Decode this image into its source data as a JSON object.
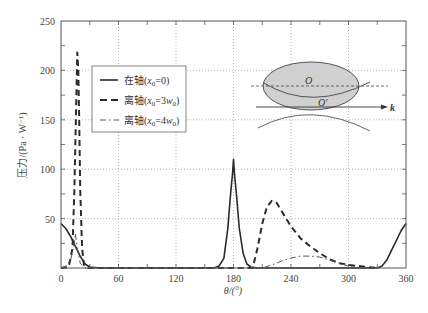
{
  "chart_data": {
    "type": "line",
    "title": "",
    "xlabel": "θ/(°)",
    "ylabel": "压力/(Pa · W⁻¹)",
    "xlim": [
      0,
      360
    ],
    "ylim": [
      0,
      250
    ],
    "xticks": [
      0,
      60,
      120,
      180,
      240,
      300,
      360
    ],
    "yticks": [
      50,
      100,
      150,
      200,
      250
    ],
    "grid": true,
    "legend_position": "upper-left-inside",
    "series": [
      {
        "name": "在轴(x0=0)",
        "style": "solid",
        "x": [
          0,
          5,
          10,
          15,
          20,
          25,
          30,
          40,
          160,
          165,
          170,
          174,
          177,
          179,
          180,
          181,
          183,
          186,
          190,
          194,
          198,
          205,
          330,
          335,
          340,
          345,
          350,
          355,
          360
        ],
        "y": [
          45,
          40,
          32,
          22,
          12,
          4,
          1,
          0,
          0,
          2,
          10,
          40,
          75,
          95,
          110,
          95,
          75,
          40,
          15,
          4,
          1,
          0,
          0,
          2,
          8,
          18,
          28,
          38,
          45
        ]
      },
      {
        "name": "离轴(x0=3w0)",
        "style": "dashed",
        "x": [
          0,
          8,
          12,
          14,
          16,
          17,
          18,
          19,
          20,
          22,
          24,
          28,
          200,
          205,
          210,
          215,
          220,
          225,
          230,
          240,
          250,
          260,
          270,
          280,
          290,
          300,
          310,
          320,
          330
        ],
        "y": [
          0,
          1,
          20,
          80,
          170,
          218,
          200,
          150,
          80,
          20,
          3,
          0,
          0,
          20,
          45,
          62,
          68,
          66,
          58,
          42,
          30,
          22,
          15,
          9,
          5,
          3,
          2,
          1,
          0
        ]
      },
      {
        "name": "离轴(x0=4w0)",
        "style": "dash-dot",
        "x": [
          0,
          5,
          10,
          13,
          15,
          17,
          20,
          25,
          210,
          220,
          230,
          240,
          250,
          260,
          270,
          280,
          290,
          300,
          310
        ],
        "y": [
          0,
          2,
          8,
          20,
          35,
          20,
          5,
          0,
          0,
          3,
          7,
          10,
          12,
          12,
          11,
          8,
          5,
          2,
          0
        ]
      }
    ],
    "inset_diagram": {
      "labels": [
        "O",
        "O'",
        "k"
      ],
      "description": "gray ellipse with dashed axis through O, curved section through O', arrow labeled k"
    }
  },
  "legend": {
    "items": [
      {
        "prefix": "在轴(",
        "var": "x",
        "sub": "0",
        "suffix": "=0)"
      },
      {
        "prefix": "离轴(",
        "var": "x",
        "sub": "0",
        "mid": "=3",
        "var2": "w",
        "sub2": "0",
        "suffix": ")"
      },
      {
        "prefix": "离轴(",
        "var": "x",
        "sub": "0",
        "mid": "=4",
        "var2": "w",
        "sub2": "0",
        "suffix": ")"
      }
    ]
  },
  "labels": {
    "xlabel": "θ/(°)",
    "ylabel": "压力/(Pa · W⁻¹)",
    "inset_O": "O",
    "inset_O_prime": "O'",
    "inset_k": "k"
  },
  "colors": {
    "line": "#2b2b2b",
    "grid": "#9a9a9a",
    "ellipse_fill": "#d0d0d0",
    "axis": "#555555"
  }
}
